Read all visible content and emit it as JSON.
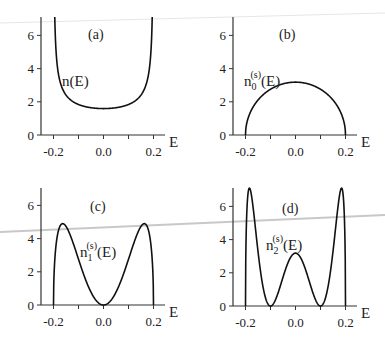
{
  "chart_data": [
    {
      "type": "line",
      "panel": "(a)",
      "curve_label": "n(E)",
      "xlabel": "E",
      "ylabel": "",
      "xlim": [
        -0.25,
        0.25
      ],
      "ylim": [
        0,
        7
      ],
      "x_ticks": [
        "-0.2",
        "0.0",
        "0.2"
      ],
      "y_ticks": [
        "0",
        "2",
        "4",
        "6"
      ],
      "function": "1/(pi*sqrt(0.04-E^2))",
      "x": [
        -0.199,
        -0.19,
        -0.15,
        -0.1,
        -0.05,
        0.0,
        0.05,
        0.1,
        0.15,
        0.19,
        0.199
      ],
      "y": [
        15.9,
        5.1,
        2.4,
        1.84,
        1.64,
        1.59,
        1.64,
        1.84,
        2.4,
        5.1,
        15.9
      ]
    },
    {
      "type": "line",
      "panel": "(b)",
      "curve_label_main": "n",
      "curve_label_sub": "0",
      "curve_label_sup": "(s)",
      "curve_label_tail": "(E)",
      "xlabel": "E",
      "xlim": [
        -0.25,
        0.25
      ],
      "ylim": [
        0,
        7
      ],
      "x_ticks": [
        "-0.2",
        "0.0",
        "0.2"
      ],
      "y_ticks": [
        "0",
        "2",
        "4",
        "6"
      ],
      "function": "semicircle, peak 3.18 at E=0",
      "x": [
        -0.2,
        -0.15,
        -0.1,
        -0.05,
        0.0,
        0.05,
        0.1,
        0.15,
        0.2
      ],
      "y": [
        0,
        2.1,
        2.76,
        3.08,
        3.18,
        3.08,
        2.76,
        2.1,
        0
      ]
    },
    {
      "type": "line",
      "panel": "(c)",
      "curve_label_main": "n",
      "curve_label_sub": "1",
      "curve_label_sup": "(s)",
      "curve_label_tail": "(E)",
      "xlabel": "E",
      "xlim": [
        -0.25,
        0.25
      ],
      "ylim": [
        0,
        7
      ],
      "x_ticks": [
        "-0.2",
        "0.0",
        "0.2"
      ],
      "y_ticks": [
        "0",
        "2",
        "4",
        "6"
      ],
      "function": "n0 * (2E/W)^2, W=0.2",
      "x": [
        -0.2,
        -0.163,
        -0.1,
        -0.05,
        0.0,
        0.05,
        0.1,
        0.163,
        0.2
      ],
      "y": [
        0,
        4.9,
        2.76,
        0.77,
        0,
        0.77,
        2.76,
        4.9,
        0
      ]
    },
    {
      "type": "line",
      "panel": "(d)",
      "curve_label_main": "n",
      "curve_label_sub": "2",
      "curve_label_sup": "(s)",
      "curve_label_tail": "(E)",
      "xlabel": "E",
      "xlim": [
        -0.25,
        0.25
      ],
      "ylim": [
        0,
        7
      ],
      "x_ticks": [
        "-0.2",
        "0.0",
        "0.2"
      ],
      "y_ticks": [
        "0",
        "2",
        "4",
        "6"
      ],
      "function": "n0 * (4(E/W)^2-1)^2, W=0.2",
      "x": [
        -0.2,
        -0.186,
        -0.1,
        0.0,
        0.1,
        0.186,
        0.2
      ],
      "y": [
        0,
        7.1,
        0,
        3.18,
        0,
        7.1,
        0
      ]
    }
  ]
}
